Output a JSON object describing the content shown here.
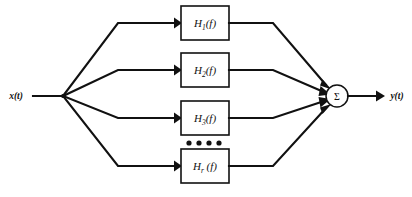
{
  "diagram": {
    "type": "block-diagram",
    "colors": {
      "background": "#ffffff",
      "line": "#111111",
      "box_fill": "#ffffff"
    },
    "input": {
      "label": "x(t)",
      "name": "input-signal-label"
    },
    "output": {
      "label": "y(t)",
      "name": "output-signal-label"
    },
    "summing_junction": {
      "symbol": "Σ",
      "name": "summing-junction"
    },
    "ellipsis": {
      "symbol": "••••",
      "dot_count": 4
    },
    "branches": [
      {
        "id": 1,
        "base": "H",
        "subscript": "1",
        "arg": "(f)",
        "label": "H₁(f)"
      },
      {
        "id": 2,
        "base": "H",
        "subscript": "2",
        "arg": "(f)",
        "label": "H₂(f)"
      },
      {
        "id": 3,
        "base": "H",
        "subscript": "3",
        "arg": "(f)",
        "label": "H₃(f)"
      },
      {
        "id": 4,
        "base": "H",
        "subscript": "r",
        "arg": "(f)",
        "label": "Hᵣ(f)"
      }
    ]
  }
}
